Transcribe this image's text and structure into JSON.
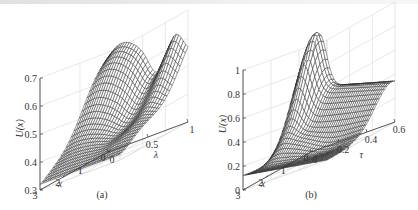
{
  "chart_data": [
    {
      "panel": "a",
      "type": "surface",
      "caption": "(a)",
      "zlabel": "U(x)",
      "xlabel": "x",
      "ylabel": "λ",
      "x_ticks": [
        "0",
        "1",
        "2",
        "3"
      ],
      "y_ticks": [
        "0",
        "0.5",
        "1"
      ],
      "z_ticks": [
        "0.3",
        "0.4",
        "0.5",
        "0.6",
        "0.7"
      ],
      "xlim": [
        0,
        3
      ],
      "ylim": [
        0,
        1
      ],
      "zlim": [
        0.3,
        0.7
      ],
      "grid": true,
      "description": "Mesh surface rising from ~0.3 at x=3 to ~0.7 peak near x=0, λ≈0.2, with a saddle/dip and secondary ridge toward λ=1"
    },
    {
      "panel": "b",
      "type": "surface",
      "caption": "(b)",
      "zlabel": "U(x)",
      "xlabel": "x",
      "ylabel": "τ",
      "x_ticks": [
        "0",
        "1",
        "2",
        "3"
      ],
      "y_ticks": [
        "0",
        "0.2",
        "0.4",
        "0.6"
      ],
      "z_ticks": [
        "0",
        "0.2",
        "0.4",
        "0.6",
        "0.8",
        "1"
      ],
      "xlim": [
        0,
        3
      ],
      "ylim": [
        0,
        0.6
      ],
      "zlim": [
        0,
        1
      ],
      "grid": true,
      "description": "Mesh surface with sharp peak ~1 near x=0, τ≈0.1, decaying ridge along τ toward 0.6, low values (~0.1) near x=3"
    }
  ],
  "page": {
    "caption_a": "(a)",
    "caption_b": "(b)"
  }
}
